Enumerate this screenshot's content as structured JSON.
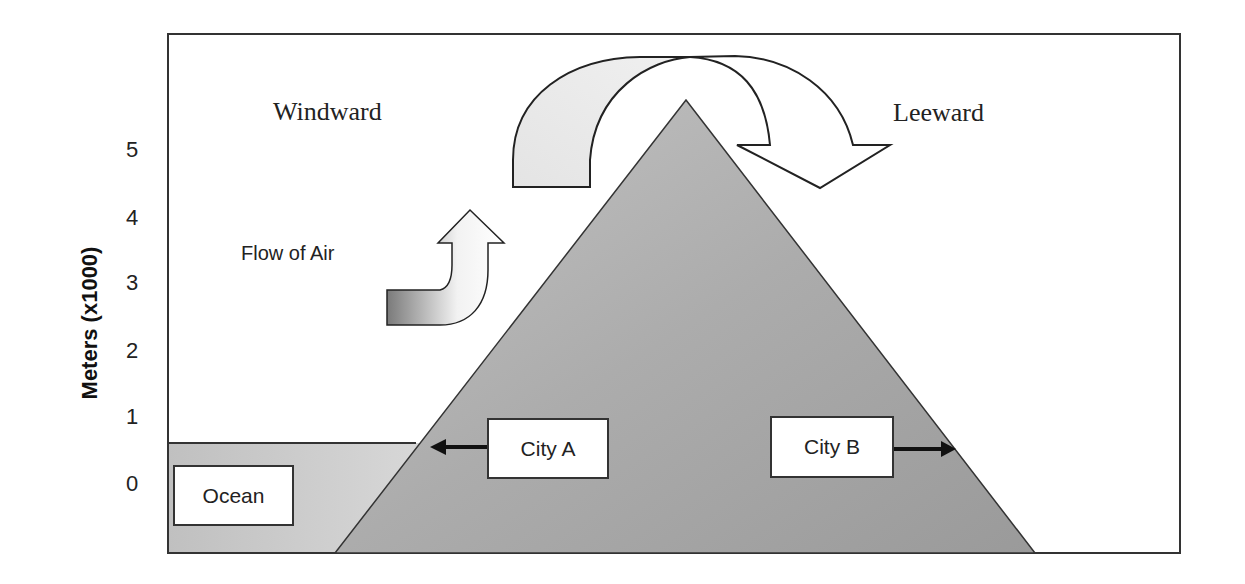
{
  "diagram": {
    "title": "",
    "y_axis": {
      "label": "Meters (x1000)",
      "ticks": [
        "5",
        "4",
        "3",
        "2",
        "1",
        "0"
      ]
    },
    "labels": {
      "windward": "Windward",
      "leeward": "Leeward",
      "flow_of_air": "Flow of Air"
    },
    "boxes": {
      "ocean": "Ocean",
      "city_a": "City A",
      "city_b": "City B"
    },
    "colors": {
      "mountain": "#a8a8a8",
      "ocean": "#c8c8c8",
      "arrow_fill_light": "#e8e8e8",
      "outline": "#222222"
    }
  }
}
